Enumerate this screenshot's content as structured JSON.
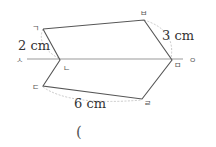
{
  "diagram": {
    "type": "line-symmetric figure",
    "axis": {
      "start_label": "ㅅ",
      "end_label": "ㅇ"
    },
    "points": [
      {
        "id": "giyeok",
        "label": "ㄱ"
      },
      {
        "id": "nieun",
        "label": "ㄴ"
      },
      {
        "id": "digeut",
        "label": "ㄷ"
      },
      {
        "id": "rieul",
        "label": "ㄹ"
      },
      {
        "id": "mieum",
        "label": "ㅁ"
      },
      {
        "id": "bieup",
        "label": "ㅂ"
      }
    ],
    "measurements": [
      {
        "id": "seg-giyeok-nieun",
        "label": "2 cm"
      },
      {
        "id": "seg-bieup-mieum",
        "label": "3 cm"
      },
      {
        "id": "seg-digeut-rieul",
        "label": "6 cm"
      }
    ],
    "answer_blank": "("
  },
  "colors": {
    "figure_line": "#555555",
    "axis_line": "#999999",
    "dashed_arc": "#bbbbbb"
  }
}
